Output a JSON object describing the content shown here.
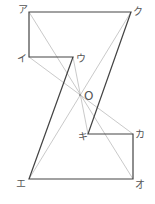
{
  "diagram": {
    "type": "geometry-figure",
    "colors": {
      "outline": "#444444",
      "guide": "#bbbbbb",
      "label": "#555555"
    },
    "points": {
      "a": {
        "label": "ア",
        "x": 29,
        "y": 12
      },
      "ku": {
        "label": "ク",
        "x": 131,
        "y": 12
      },
      "i": {
        "label": "イ",
        "x": 29,
        "y": 57
      },
      "u": {
        "label": "ウ",
        "x": 73,
        "y": 57
      },
      "o_center": {
        "label": "O",
        "x": 80,
        "y": 95
      },
      "ki": {
        "label": "キ",
        "x": 88,
        "y": 134
      },
      "ka": {
        "label": "カ",
        "x": 133,
        "y": 134
      },
      "e": {
        "label": "エ",
        "x": 29,
        "y": 179
      },
      "o": {
        "label": "オ",
        "x": 133,
        "y": 179
      }
    },
    "polygon_order": [
      "ア",
      "ク",
      "キ",
      "カ",
      "オ",
      "エ",
      "ウ",
      "イ"
    ],
    "guide_lines": [
      [
        "ア",
        "オ"
      ],
      [
        "ク",
        "エ"
      ],
      [
        "イ",
        "カ"
      ],
      [
        "ウ",
        "キ"
      ]
    ]
  }
}
